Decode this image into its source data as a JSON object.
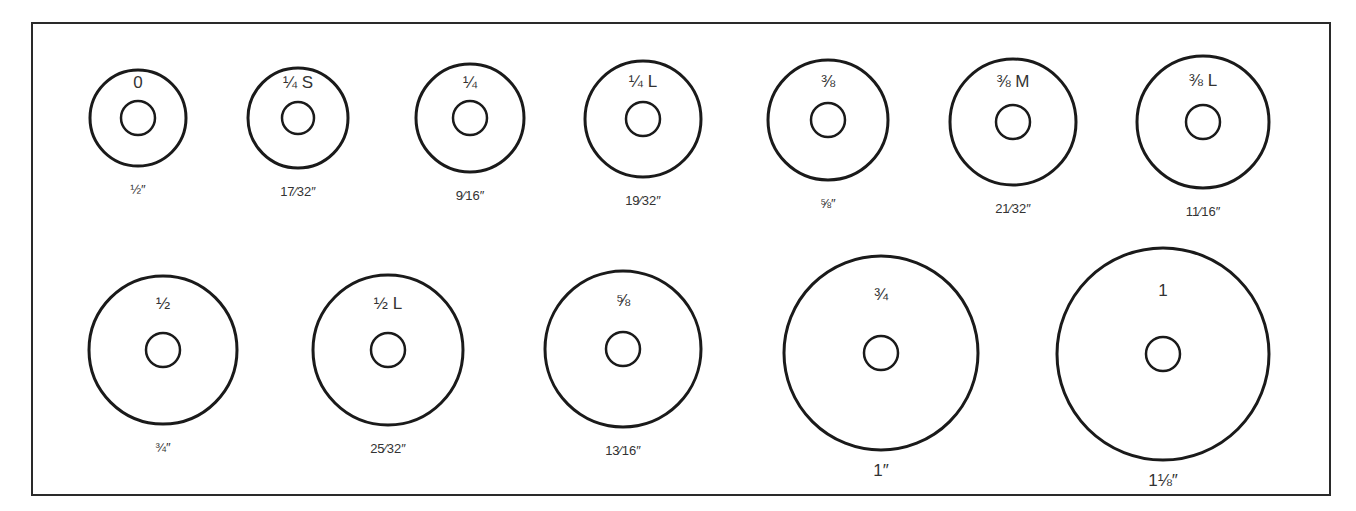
{
  "colors": {
    "stroke": "#1a1a1a",
    "text": "#333333",
    "background": "#ffffff"
  },
  "washers": [
    {
      "row": 1,
      "size": "0",
      "tag": "",
      "diameter": "1/2\"",
      "cx": 138,
      "cy": 118,
      "r": 48,
      "hole_r": 17
    },
    {
      "row": 1,
      "size": "1/4",
      "tag": "S",
      "diameter": "17/32\"",
      "cx": 298,
      "cy": 118,
      "r": 50,
      "hole_r": 16
    },
    {
      "row": 1,
      "size": "1/4",
      "tag": "",
      "diameter": "9/16\"",
      "cx": 470,
      "cy": 118,
      "r": 54,
      "hole_r": 17
    },
    {
      "row": 1,
      "size": "1/4",
      "tag": "L",
      "diameter": "19/32\"",
      "cx": 643,
      "cy": 119,
      "r": 58,
      "hole_r": 17
    },
    {
      "row": 1,
      "size": "3/8",
      "tag": "",
      "diameter": "5/8\"",
      "cx": 828,
      "cy": 120,
      "r": 60,
      "hole_r": 17
    },
    {
      "row": 1,
      "size": "3/8",
      "tag": "M",
      "diameter": "21/32\"",
      "cx": 1013,
      "cy": 122,
      "r": 63,
      "hole_r": 17
    },
    {
      "row": 1,
      "size": "3/8",
      "tag": "L",
      "diameter": "11/16\"",
      "cx": 1203,
      "cy": 122,
      "r": 66,
      "hole_r": 17
    },
    {
      "row": 2,
      "size": "1/2",
      "tag": "",
      "diameter": "3/4\"",
      "cx": 163,
      "cy": 350,
      "r": 74,
      "hole_r": 17
    },
    {
      "row": 2,
      "size": "1/2",
      "tag": "L",
      "diameter": "25/32\"",
      "cx": 388,
      "cy": 350,
      "r": 75,
      "hole_r": 17
    },
    {
      "row": 2,
      "size": "5/8",
      "tag": "",
      "diameter": "13/16\"",
      "cx": 623,
      "cy": 349,
      "r": 78,
      "hole_r": 17
    },
    {
      "row": 2,
      "size": "3/4",
      "tag": "",
      "diameter": "1\"",
      "cx": 881,
      "cy": 353,
      "r": 97,
      "hole_r": 17
    },
    {
      "row": 2,
      "size": "1",
      "tag": "",
      "diameter": "1 1/8\"",
      "cx": 1163,
      "cy": 354,
      "r": 106,
      "hole_r": 17
    }
  ],
  "display": {
    "sizes": [
      "0",
      "¼ S",
      "¼",
      "¼ L",
      "⅜",
      "⅜ M",
      "⅜ L",
      "½",
      "½ L",
      "⅝",
      "¾",
      "1"
    ],
    "diameters": [
      "½″",
      "17⁄32″",
      "9⁄16″",
      "19⁄32″",
      "⅝″",
      "21⁄32″",
      "11⁄16″",
      "¾″",
      "25⁄32″",
      "13⁄16″",
      "1″",
      "1⅛″"
    ]
  }
}
